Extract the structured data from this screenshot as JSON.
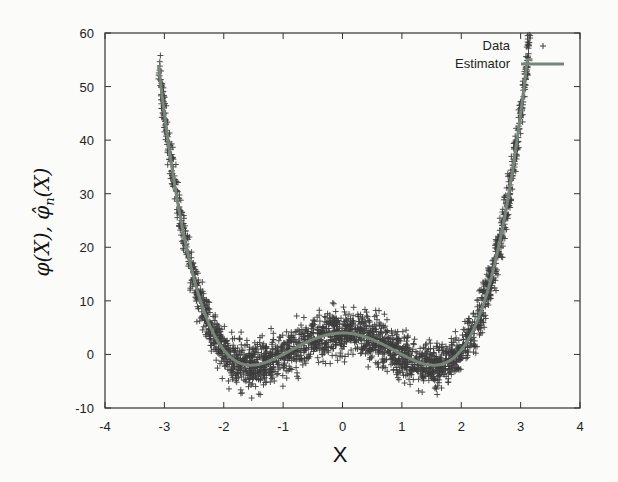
{
  "chart_data": {
    "type": "scatter",
    "title": "",
    "xlabel": "X",
    "ylabel": "φ(X), φ̂ₙ(X)",
    "xlim": [
      -4,
      4
    ],
    "ylim": [
      -10,
      60
    ],
    "x_ticks": [
      -4,
      -3,
      -2,
      -1,
      0,
      1,
      2,
      3,
      4
    ],
    "x_tick_labels": [
      "-4",
      "-3",
      "-2",
      "-1",
      "0",
      "1",
      "2",
      "3",
      "4"
    ],
    "y_ticks": [
      -10,
      0,
      10,
      20,
      30,
      40,
      50,
      60
    ],
    "y_tick_labels": [
      "-10",
      "0",
      "10",
      "20",
      "30",
      "40",
      "50",
      "60"
    ],
    "grid": false,
    "legend_position": "top-right",
    "series": [
      {
        "name": "Data",
        "kind": "scatter",
        "marker": "+",
        "color": "#3d3d3d",
        "x_range": [
          -3.1,
          3.2
        ],
        "n_points": 2500,
        "noise_amplitude": 3.0,
        "approx_model": "1.069*x^4 - 5.07*x^2 + 4"
      },
      {
        "name": "Estimator",
        "kind": "line",
        "color": "#7a857a",
        "line_width": 3,
        "x_range": [
          -3.1,
          3.2
        ],
        "sample_points": {
          "x": [
            -3.1,
            -3.0,
            -2.5,
            -2.0,
            -1.54,
            -1.0,
            -0.5,
            0.0,
            0.5,
            1.0,
            1.54,
            2.0,
            2.5,
            3.0,
            3.2
          ],
          "y": [
            54.0,
            45.0,
            14.1,
            0.8,
            -2.0,
            0.0,
            2.8,
            4.0,
            2.8,
            0.0,
            -2.0,
            0.8,
            14.1,
            45.0,
            61.6
          ]
        }
      }
    ],
    "legend": [
      {
        "label": "Data",
        "symbol": "+"
      },
      {
        "label": "Estimator",
        "symbol": "line"
      }
    ]
  },
  "axes": {
    "xlabel": "X",
    "ylabel_parts": {
      "phi": "φ(X), ",
      "phihat": "φ̂",
      "sub": "n",
      "tail": "(X)"
    }
  },
  "colors": {
    "background": "#fbfbfa",
    "axis": "#333333",
    "data": "#3d3d3d",
    "estimator": "#7a857a"
  }
}
